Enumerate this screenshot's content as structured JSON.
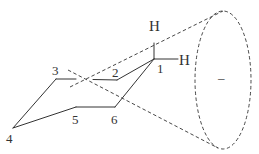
{
  "diagram": {
    "title": "",
    "atoms": [
      {
        "id": "C1",
        "label": "1",
        "x": 154,
        "y": 59
      },
      {
        "id": "C2",
        "label": "2",
        "x": 117,
        "y": 80
      },
      {
        "id": "C3",
        "label": "3",
        "x": 56,
        "y": 79
      },
      {
        "id": "C4",
        "label": "4",
        "x": 13,
        "y": 128
      },
      {
        "id": "C5",
        "label": "5",
        "x": 75,
        "y": 107
      },
      {
        "id": "C6",
        "label": "6",
        "x": 115,
        "y": 107
      }
    ],
    "hydrogens": [
      {
        "id": "H-axial",
        "label": "H",
        "attached_to": "C1",
        "position": "up"
      },
      {
        "id": "H-equatorial",
        "label": "H",
        "attached_to": "C1",
        "position": "right"
      }
    ],
    "cone": {
      "description": "dashed cone from ring center to ellipse",
      "ellipse_label": "–"
    },
    "labels": {
      "c1": "1",
      "c2": "2",
      "c3": "3",
      "c4": "4",
      "c5": "5",
      "c6": "6",
      "h_top": "H",
      "h_right": "H",
      "ellipse_sign": "–"
    },
    "colors": {
      "stroke": "#333333",
      "background": "#ffffff"
    }
  }
}
